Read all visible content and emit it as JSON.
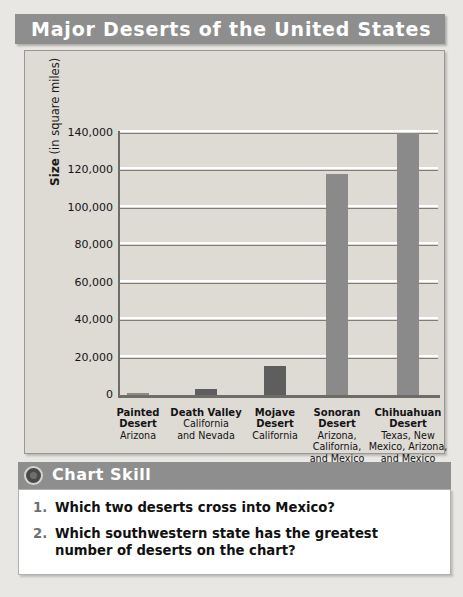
{
  "header": {
    "title": "Major Deserts of the United States"
  },
  "chart_panel": {
    "y_axis_title_bold": "Size",
    "y_axis_title_rest": " (in square miles)",
    "source": "Source: World Almanac 2001"
  },
  "chart_data": {
    "type": "bar",
    "title": "Major Deserts of the United States",
    "xlabel": "",
    "ylabel": "Size (in square miles)",
    "ylim": [
      0,
      140000
    ],
    "yticks": [
      0,
      20000,
      40000,
      60000,
      80000,
      100000,
      120000,
      140000
    ],
    "ytick_labels": [
      "0",
      "20,000",
      "40,000",
      "60,000",
      "80,000",
      "100,000",
      "120,000",
      "140,000"
    ],
    "grid": true,
    "legend": "none",
    "categories": [
      "Painted Desert",
      "Death Valley",
      "Mojave Desert",
      "Sonoran Desert",
      "Chihuahuan Desert"
    ],
    "values": [
      1000,
      3000,
      15500,
      118000,
      140000
    ],
    "bar_color": "#8a8a8a",
    "bars": [
      {
        "name": "Painted",
        "name_line2": "Desert",
        "states": "Arizona",
        "value": 1000,
        "color": "#8a8a8a"
      },
      {
        "name": "Death Valley",
        "name_line2": "California",
        "states": "and Nevada",
        "value": 3000,
        "color": "#5e5e5e"
      },
      {
        "name": "Mojave",
        "name_line2": "Desert",
        "states": "California",
        "value": 15500,
        "color": "#5e5e5e"
      },
      {
        "name": "Sonoran",
        "name_line2": "Desert",
        "states": "Arizona,\nCalifornia,\nand Mexico",
        "value": 118000,
        "color": "#8a8a8a"
      },
      {
        "name": "Chihuahuan",
        "name_line2": "Desert",
        "states": "Texas, New\nMexico, Arizona,\nand Mexico",
        "value": 140000,
        "color": "#8a8a8a"
      }
    ]
  },
  "skill_section": {
    "icon": "circle-bullet-icon",
    "label": "Chart Skill",
    "questions": [
      {
        "number": "1.",
        "text": "Which two deserts cross into Mexico?"
      },
      {
        "number": "2.",
        "text": "Which southwestern state has the greatest number of deserts on the chart?"
      }
    ]
  },
  "colors": {
    "banner": "#8e8e8e",
    "panel": "#dedad4",
    "page": "#e9e7e3",
    "bar": "#8a8a8a",
    "bar_dark": "#5e5e5e",
    "gridline": "#7f7d79"
  }
}
